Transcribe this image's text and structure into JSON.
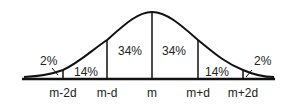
{
  "diagram": {
    "regions": [
      {
        "label": "2%",
        "position": "left-tail"
      },
      {
        "label": "14%",
        "position": "m-2d to m-d"
      },
      {
        "label": "34%",
        "position": "m-d to m"
      },
      {
        "label": "34%",
        "position": "m to m+d"
      },
      {
        "label": "14%",
        "position": "m+d to m+2d"
      },
      {
        "label": "2%",
        "position": "right-tail"
      }
    ],
    "axis_ticks": [
      "m-2d",
      "m-d",
      "m",
      "m+d",
      "m+2d"
    ],
    "colors": {
      "line": "#111111",
      "text": "#222222",
      "background": "#ffffff"
    }
  }
}
